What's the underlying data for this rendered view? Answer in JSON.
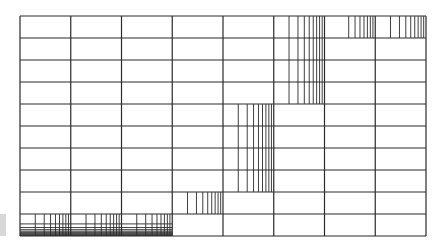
{
  "diagram": {
    "title": "",
    "grid": {
      "columns": 8,
      "rows": 10,
      "line_color": "#2a2a2a"
    },
    "log_regions": [
      {
        "id": "row0-col6",
        "orientation": "vertical",
        "col_start": 6,
        "col_end": 6,
        "row_start": 0,
        "row_end": 0,
        "k_start": 3
      },
      {
        "id": "row0-col7",
        "orientation": "vertical",
        "col_start": 7,
        "col_end": 7,
        "row_start": 0,
        "row_end": 0,
        "k_start": 2
      },
      {
        "id": "col5-rows0-3",
        "orientation": "vertical",
        "col_start": 5,
        "col_end": 5,
        "row_start": 0,
        "row_end": 3,
        "k_start": 2
      },
      {
        "id": "col4-rows4-7",
        "orientation": "vertical",
        "col_start": 4,
        "col_end": 4,
        "row_start": 4,
        "row_end": 7,
        "k_start": 2
      },
      {
        "id": "col3-row8",
        "orientation": "vertical",
        "col_start": 3,
        "col_end": 3,
        "row_start": 8,
        "row_end": 8,
        "k_start": 2
      },
      {
        "id": "cols0-2-row9",
        "orientation": "vertical",
        "col_start": 0,
        "col_end": 2,
        "row_start": 9,
        "row_end": 9,
        "k_start": 2
      },
      {
        "id": "cols0-2-row9-h",
        "orientation": "horizontal",
        "col_start": 0,
        "col_end": 2,
        "row_start": 9,
        "row_end": 9,
        "k_start": 2
      }
    ],
    "side_marker_color": "#d8d8d8"
  }
}
